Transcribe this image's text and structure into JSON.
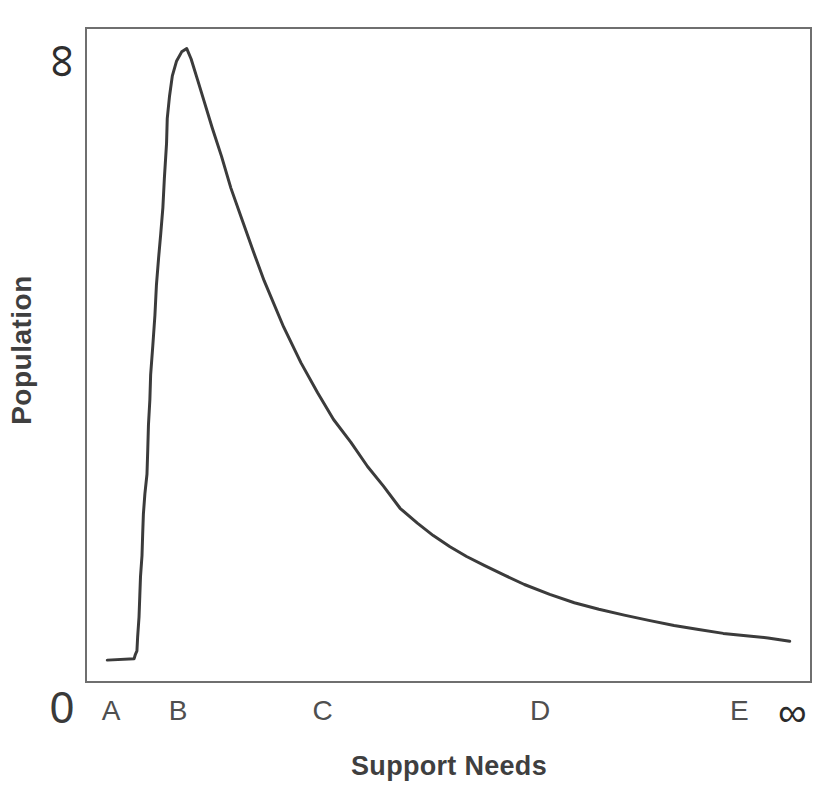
{
  "figure": {
    "background": "#ffffff",
    "frame_color": "#6f6f6f",
    "curve_color": "#3b3b3b",
    "tick_color": "#4f4f4f",
    "label_color": "#3f3f3f"
  },
  "chart_data": {
    "type": "line",
    "title": "",
    "xlabel": "Support Needs",
    "ylabel": "Population",
    "grid": false,
    "legend": false,
    "x_axis": {
      "origin_label": "0",
      "tick_labels": [
        "A",
        "B",
        "C",
        "D",
        "E",
        "∞"
      ],
      "tick_positions": [
        0.036,
        0.128,
        0.327,
        0.626,
        0.9,
        0.973
      ],
      "range": [
        0,
        1
      ]
    },
    "y_axis": {
      "max_label": "∞",
      "range": [
        0,
        1
      ]
    },
    "curve_points": [
      [
        0.028,
        0.032
      ],
      [
        0.065,
        0.034
      ],
      [
        0.067,
        0.041
      ],
      [
        0.069,
        0.046
      ],
      [
        0.07,
        0.067
      ],
      [
        0.072,
        0.098
      ],
      [
        0.073,
        0.131
      ],
      [
        0.074,
        0.16
      ],
      [
        0.076,
        0.192
      ],
      [
        0.077,
        0.226
      ],
      [
        0.078,
        0.256
      ],
      [
        0.08,
        0.287
      ],
      [
        0.083,
        0.317
      ],
      [
        0.084,
        0.355
      ],
      [
        0.085,
        0.393
      ],
      [
        0.087,
        0.431
      ],
      [
        0.088,
        0.47
      ],
      [
        0.091,
        0.515
      ],
      [
        0.094,
        0.561
      ],
      [
        0.096,
        0.607
      ],
      [
        0.099,
        0.649
      ],
      [
        0.102,
        0.687
      ],
      [
        0.105,
        0.726
      ],
      [
        0.107,
        0.771
      ],
      [
        0.11,
        0.825
      ],
      [
        0.111,
        0.863
      ],
      [
        0.114,
        0.896
      ],
      [
        0.118,
        0.928
      ],
      [
        0.124,
        0.951
      ],
      [
        0.131,
        0.965
      ],
      [
        0.138,
        0.97
      ],
      [
        0.144,
        0.954
      ],
      [
        0.153,
        0.922
      ],
      [
        0.162,
        0.889
      ],
      [
        0.173,
        0.849
      ],
      [
        0.186,
        0.805
      ],
      [
        0.199,
        0.756
      ],
      [
        0.215,
        0.706
      ],
      [
        0.23,
        0.659
      ],
      [
        0.245,
        0.614
      ],
      [
        0.272,
        0.543
      ],
      [
        0.296,
        0.488
      ],
      [
        0.319,
        0.442
      ],
      [
        0.341,
        0.401
      ],
      [
        0.365,
        0.366
      ],
      [
        0.388,
        0.329
      ],
      [
        0.41,
        0.299
      ],
      [
        0.433,
        0.265
      ],
      [
        0.457,
        0.242
      ],
      [
        0.479,
        0.223
      ],
      [
        0.502,
        0.206
      ],
      [
        0.525,
        0.191
      ],
      [
        0.55,
        0.177
      ],
      [
        0.578,
        0.162
      ],
      [
        0.605,
        0.148
      ],
      [
        0.64,
        0.133
      ],
      [
        0.674,
        0.12
      ],
      [
        0.708,
        0.11
      ],
      [
        0.743,
        0.101
      ],
      [
        0.777,
        0.093
      ],
      [
        0.812,
        0.085
      ],
      [
        0.846,
        0.079
      ],
      [
        0.88,
        0.073
      ],
      [
        0.915,
        0.069
      ],
      [
        0.942,
        0.066
      ],
      [
        0.972,
        0.061
      ]
    ]
  }
}
